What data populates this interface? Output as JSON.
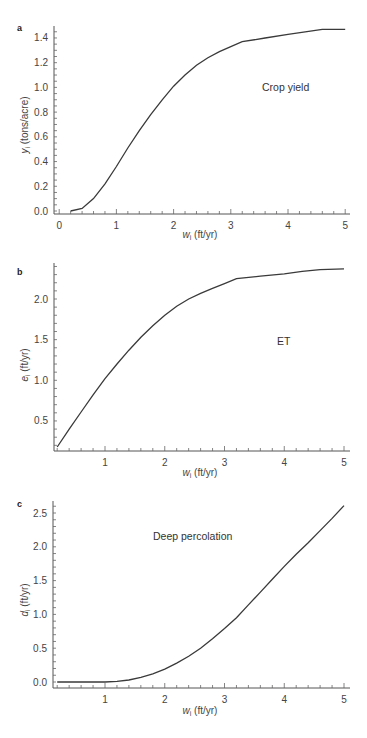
{
  "chart_data": [
    {
      "panel": "a",
      "type": "line",
      "title": "",
      "annotation": "Crop yield",
      "xlabel": "w_i (ft/yr)",
      "ylabel": "y_i (tons/acre)",
      "xlim": [
        0,
        5
      ],
      "ylim": [
        0,
        1.4
      ],
      "xticks": [
        "0",
        "1",
        "2",
        "3",
        "4",
        "5"
      ],
      "yticks": [
        "0.0",
        "0.2",
        "0.4",
        "0.6",
        "0.8",
        "1.0",
        "1.2",
        "1.4"
      ],
      "grid": false,
      "x": [
        0.2,
        0.4,
        0.6,
        0.8,
        1.0,
        1.2,
        1.4,
        1.6,
        1.8,
        2.0,
        2.2,
        2.4,
        2.6,
        2.8,
        3.0,
        3.2,
        3.6,
        4.0,
        4.3,
        4.6,
        5.0
      ],
      "y": [
        0.0,
        0.02,
        0.1,
        0.22,
        0.36,
        0.51,
        0.65,
        0.78,
        0.9,
        1.01,
        1.1,
        1.18,
        1.24,
        1.29,
        1.33,
        1.37,
        1.4,
        1.43,
        1.45,
        1.47,
        1.47
      ]
    },
    {
      "panel": "b",
      "type": "line",
      "title": "",
      "annotation": "ET",
      "xlabel": "w_i (ft/yr)",
      "ylabel": "e_i (ft/yr)",
      "xlim": [
        0.15,
        5
      ],
      "ylim": [
        0.15,
        2.4
      ],
      "xticks": [
        "1",
        "2",
        "3",
        "4",
        "5"
      ],
      "yticks": [
        "0.5",
        "1.0",
        "1.5",
        "2.0"
      ],
      "grid": false,
      "x": [
        0.2,
        0.4,
        0.6,
        0.8,
        1.0,
        1.2,
        1.4,
        1.6,
        1.8,
        2.0,
        2.2,
        2.4,
        2.6,
        2.8,
        3.0,
        3.2,
        3.6,
        4.0,
        4.3,
        4.6,
        5.0
      ],
      "y": [
        0.18,
        0.4,
        0.61,
        0.82,
        1.02,
        1.2,
        1.37,
        1.53,
        1.67,
        1.8,
        1.91,
        2.0,
        2.07,
        2.13,
        2.19,
        2.25,
        2.28,
        2.31,
        2.34,
        2.36,
        2.37
      ]
    },
    {
      "panel": "c",
      "type": "line",
      "title": "",
      "annotation": "Deep percolation",
      "xlabel": "w_i (ft/yr)",
      "ylabel": "d_i (ft/yr)",
      "xlim": [
        0.15,
        5
      ],
      "ylim": [
        0,
        2.6
      ],
      "xticks": [
        "1",
        "2",
        "3",
        "4",
        "5"
      ],
      "yticks": [
        "0.0",
        "0.5",
        "1.0",
        "1.5",
        "2.0",
        "2.5"
      ],
      "grid": false,
      "x": [
        0.2,
        0.6,
        1.0,
        1.2,
        1.4,
        1.6,
        1.8,
        2.0,
        2.2,
        2.4,
        2.6,
        2.8,
        3.0,
        3.2,
        3.4,
        3.6,
        3.8,
        4.0,
        4.2,
        4.4,
        4.6,
        4.8,
        5.0
      ],
      "y": [
        0.0,
        0.0,
        0.0,
        0.01,
        0.03,
        0.07,
        0.12,
        0.19,
        0.28,
        0.38,
        0.5,
        0.64,
        0.79,
        0.95,
        1.14,
        1.33,
        1.52,
        1.71,
        1.89,
        2.06,
        2.24,
        2.42,
        2.61
      ]
    }
  ],
  "panels": {
    "a": {
      "letter": "a",
      "annotation": "Crop yield",
      "ylabel_var": "y",
      "ylabel_sub": "i",
      "ylabel_unit": " (tons/acre)",
      "xlabel_var": "w",
      "xlabel_sub": "i",
      "xlabel_unit": " (ft/yr)"
    },
    "b": {
      "letter": "b",
      "annotation": "ET",
      "ylabel_var": "e",
      "ylabel_sub": "i",
      "ylabel_unit": " (ft/yr)",
      "xlabel_var": "w",
      "xlabel_sub": "i",
      "xlabel_unit": " (ft/yr)"
    },
    "c": {
      "letter": "c",
      "annotation": "Deep percolation",
      "ylabel_var": "d",
      "ylabel_sub": "i",
      "ylabel_unit": " (ft/yr)",
      "xlabel_var": "w",
      "xlabel_sub": "i",
      "xlabel_unit": " (ft/yr)"
    }
  }
}
